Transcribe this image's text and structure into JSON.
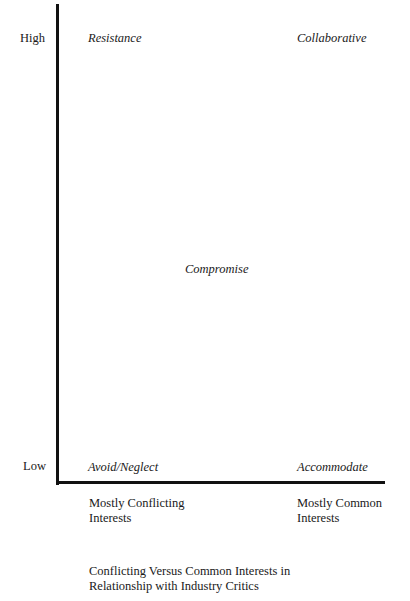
{
  "diagram": {
    "type": "2x2-strategy-matrix",
    "y_axis": {
      "high_label": "High",
      "low_label": "Low"
    },
    "x_axis": {
      "left_label_line1": "Mostly Conflicting",
      "left_label_line2": "Interests",
      "right_label_line1": "Mostly Common",
      "right_label_line2": "Interests",
      "title_line1": "Conflicting Versus Common Interests in",
      "title_line2": "Relationship with Industry Critics"
    },
    "quadrants": {
      "top_left": "Resistance",
      "top_right": "Collaborative",
      "center": "Compromise",
      "bottom_left": "Avoid/Neglect",
      "bottom_right": "Accommodate"
    },
    "colors": {
      "axis": "#111111",
      "text": "#1a1a1a",
      "background": "#ffffff"
    }
  }
}
